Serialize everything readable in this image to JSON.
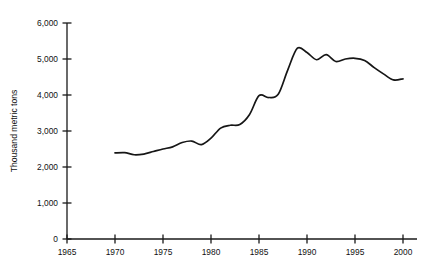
{
  "chart_data": {
    "type": "line",
    "title": "",
    "subtitle": "",
    "xlabel": "",
    "ylabel": "Thousand metric tons",
    "xlim": [
      1965,
      2000
    ],
    "ylim": [
      0,
      6000
    ],
    "grid": false,
    "legend": null,
    "x_ticks": [
      "1965",
      "1970",
      "1975",
      "1980",
      "1985",
      "1990",
      "1995",
      "2000"
    ],
    "x_tick_values": [
      1965,
      1970,
      1975,
      1980,
      1985,
      1990,
      1995,
      2000
    ],
    "y_ticks": [
      "0",
      "1,000",
      "2,000",
      "3,000",
      "4,000",
      "5,000",
      "6,000"
    ],
    "y_tick_values": [
      0,
      1000,
      2000,
      3000,
      4000,
      5000,
      6000
    ],
    "series": [
      {
        "name": "Thousand metric tons",
        "color": "#161616",
        "x": [
          1970,
          1971,
          1972,
          1973,
          1974,
          1975,
          1976,
          1977,
          1978,
          1979,
          1980,
          1981,
          1982,
          1983,
          1984,
          1985,
          1986,
          1987,
          1988,
          1989,
          1990,
          1991,
          1992,
          1993,
          1994,
          1995,
          1996,
          1997,
          1998,
          1999,
          2000
        ],
        "values": [
          2390,
          2400,
          2340,
          2360,
          2430,
          2500,
          2560,
          2680,
          2720,
          2620,
          2800,
          3080,
          3160,
          3180,
          3450,
          3980,
          3930,
          4020,
          4700,
          5300,
          5180,
          4980,
          5120,
          4930,
          5000,
          5020,
          4960,
          4760,
          4580,
          4420,
          4450
        ]
      }
    ],
    "axes_colors": {
      "axis": "#1a1a1a",
      "line": "#161616",
      "text": "#111111",
      "background": "#ffffff"
    }
  },
  "geometry": {
    "plot_left": 67,
    "plot_right": 403,
    "plot_bottom": 239,
    "plot_top": 23,
    "x_min": 1965,
    "x_max": 2000,
    "y_min": 0,
    "y_max": 6000
  }
}
